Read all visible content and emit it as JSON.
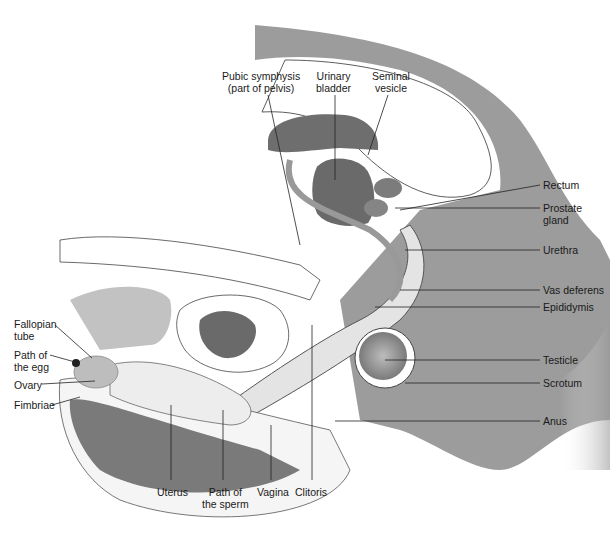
{
  "diagram": {
    "type": "anatomical-illustration",
    "colors": {
      "skin_dark": "#8c8c8c",
      "skin_mid": "#b5b5b5",
      "organ_dark": "#6e6e6e",
      "organ_light": "#d8d8d8",
      "outline": "#333333",
      "background": "#ffffff"
    },
    "labels": {
      "pubic_symphysis": "Pubic symphysis\n(part of pelvis)",
      "urinary_bladder": "Urinary\nbladder",
      "seminal_vesicle": "Seminal\nvesicle",
      "rectum": "Rectum",
      "prostate_gland": "Prostate\ngland",
      "urethra": "Urethra",
      "vas_deferens": "Vas deferens",
      "epididymis": "Epididymis",
      "testicle": "Testicle",
      "scrotum": "Scrotum",
      "anus": "Anus",
      "fallopian_tube": "Fallopian\ntube",
      "path_of_egg": "Path of\nthe egg",
      "ovary": "Ovary",
      "fimbriae": "Fimbriae",
      "uterus": "Uterus",
      "path_of_sperm": "Path of\nthe sperm",
      "vagina": "Vagina",
      "clitoris": "Clitoris"
    }
  }
}
